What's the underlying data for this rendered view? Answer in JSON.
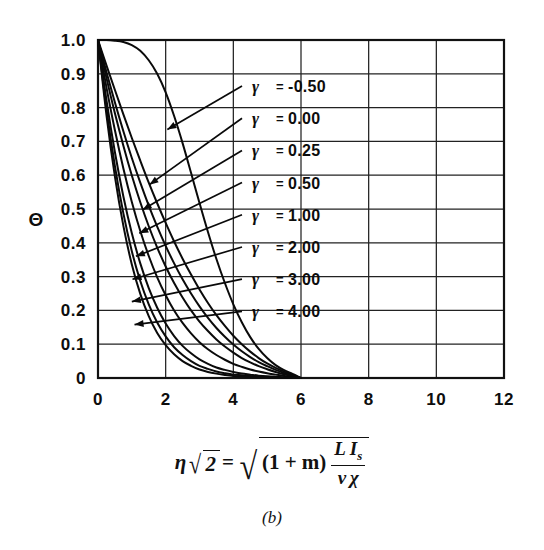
{
  "figure": {
    "panel_label": "(b)",
    "background_color": "#ffffff",
    "ink_color": "#0a0a0a"
  },
  "formula": {
    "lhs_var": "η",
    "lhs_radicand": "2",
    "equals": "=",
    "rhs_paren": "(1 + m)",
    "rhs_numerator_1": "L",
    "rhs_numerator_2": "I",
    "rhs_numerator_2_sub": "s",
    "rhs_denominator_1": "ν",
    "rhs_denominator_2": "χ",
    "plain_text": "η√2 = √( (1+m) L I_s / (ν χ) )"
  },
  "chart_data": {
    "type": "line",
    "title": "",
    "subtitle": "",
    "xlabel": "η√2 = √((1+m) L I_s / (ν χ))",
    "ylabel": "Θ",
    "xlim": [
      0,
      12
    ],
    "ylim": [
      0,
      1.0
    ],
    "xticks": [
      0,
      2,
      4,
      6,
      8,
      10,
      12
    ],
    "xticklabels": [
      "0",
      "2",
      "4",
      "6",
      "8",
      "10",
      "12"
    ],
    "yticks": [
      0,
      0.1,
      0.2,
      0.3,
      0.4,
      0.5,
      0.6,
      0.7,
      0.8,
      0.9,
      1.0
    ],
    "yticklabels": [
      "0",
      "0.1",
      "0.2",
      "0.3",
      "0.4",
      "0.5",
      "0.6",
      "0.7",
      "0.8",
      "0.9",
      "1.0"
    ],
    "grid": true,
    "grid_x_step": 2,
    "grid_y_step": 0.1,
    "legend_position": "inside-upper-right",
    "legend_symbol": "γ",
    "legend_equals": "=",
    "series": [
      {
        "name": "γ = -0.50",
        "gamma": -0.5,
        "label_value": "-0.50",
        "x": [
          0.0,
          0.25,
          0.5,
          0.75,
          1.0,
          1.25,
          1.5,
          1.75,
          2.0,
          2.25,
          2.5,
          2.75,
          3.0,
          3.25,
          3.5,
          3.75,
          4.0,
          4.25,
          4.5,
          4.75,
          5.0,
          5.25,
          5.5,
          5.75,
          6.0
        ],
        "y": [
          1.0,
          1.0,
          0.998,
          0.994,
          0.985,
          0.968,
          0.94,
          0.9,
          0.845,
          0.775,
          0.695,
          0.607,
          0.518,
          0.432,
          0.352,
          0.281,
          0.218,
          0.165,
          0.121,
          0.086,
          0.059,
          0.038,
          0.023,
          0.012,
          0.0
        ]
      },
      {
        "name": "γ = 0.00",
        "gamma": 0.0,
        "label_value": "0.00",
        "x": [
          0.0,
          0.25,
          0.5,
          0.75,
          1.0,
          1.25,
          1.5,
          1.75,
          2.0,
          2.25,
          2.5,
          2.75,
          3.0,
          3.25,
          3.5,
          3.75,
          4.0,
          4.25,
          4.5,
          4.75,
          5.0,
          5.25,
          5.5,
          5.75,
          6.0
        ],
        "y": [
          1.0,
          0.925,
          0.852,
          0.78,
          0.71,
          0.643,
          0.578,
          0.517,
          0.459,
          0.404,
          0.353,
          0.306,
          0.262,
          0.222,
          0.186,
          0.154,
          0.125,
          0.1,
          0.078,
          0.059,
          0.043,
          0.03,
          0.019,
          0.009,
          0.0
        ]
      },
      {
        "name": "γ = 0.25",
        "gamma": 0.25,
        "label_value": "0.25",
        "x": [
          0.0,
          0.25,
          0.5,
          0.75,
          1.0,
          1.25,
          1.5,
          1.75,
          2.0,
          2.25,
          2.5,
          2.75,
          3.0,
          3.25,
          3.5,
          3.75,
          4.0,
          4.25,
          4.5,
          4.75,
          5.0,
          5.25,
          5.5,
          5.75,
          6.0
        ],
        "y": [
          1.0,
          0.905,
          0.815,
          0.73,
          0.651,
          0.578,
          0.51,
          0.448,
          0.391,
          0.339,
          0.292,
          0.25,
          0.212,
          0.178,
          0.148,
          0.122,
          0.099,
          0.079,
          0.062,
          0.047,
          0.035,
          0.024,
          0.015,
          0.007,
          0.0
        ]
      },
      {
        "name": "γ = 0.50",
        "gamma": 0.5,
        "label_value": "0.50",
        "x": [
          0.0,
          0.25,
          0.5,
          0.75,
          1.0,
          1.25,
          1.5,
          1.75,
          2.0,
          2.25,
          2.5,
          2.75,
          3.0,
          3.25,
          3.5,
          3.75,
          4.0,
          4.25,
          4.5,
          4.75,
          5.0,
          5.25,
          5.5,
          5.75,
          6.0
        ],
        "y": [
          1.0,
          0.888,
          0.783,
          0.687,
          0.599,
          0.52,
          0.449,
          0.386,
          0.33,
          0.281,
          0.238,
          0.2,
          0.167,
          0.139,
          0.114,
          0.093,
          0.075,
          0.059,
          0.046,
          0.035,
          0.026,
          0.018,
          0.011,
          0.005,
          0.0
        ]
      },
      {
        "name": "γ = 1.00",
        "gamma": 1.0,
        "label_value": "1.00",
        "x": [
          0.0,
          0.25,
          0.5,
          0.75,
          1.0,
          1.25,
          1.5,
          1.75,
          2.0,
          2.25,
          2.5,
          2.75,
          3.0,
          3.25,
          3.5,
          3.75,
          4.0,
          4.25,
          4.5,
          4.75,
          5.0,
          5.25,
          5.5,
          5.75,
          6.0
        ],
        "y": [
          1.0,
          0.86,
          0.733,
          0.62,
          0.521,
          0.435,
          0.361,
          0.298,
          0.245,
          0.2,
          0.163,
          0.132,
          0.106,
          0.085,
          0.068,
          0.054,
          0.042,
          0.033,
          0.025,
          0.019,
          0.014,
          0.01,
          0.006,
          0.003,
          0.0
        ]
      },
      {
        "name": "γ = 2.00",
        "gamma": 2.0,
        "label_value": "2.00",
        "x": [
          0.0,
          0.25,
          0.5,
          0.75,
          1.0,
          1.25,
          1.5,
          1.75,
          2.0,
          2.25,
          2.5,
          2.75,
          3.0,
          3.25,
          3.5,
          3.75,
          4.0,
          4.25,
          4.5,
          4.75,
          5.0,
          5.25,
          5.5,
          5.75,
          6.0
        ],
        "y": [
          1.0,
          0.822,
          0.668,
          0.537,
          0.428,
          0.339,
          0.266,
          0.208,
          0.161,
          0.124,
          0.095,
          0.073,
          0.055,
          0.042,
          0.031,
          0.024,
          0.018,
          0.013,
          0.01,
          0.007,
          0.005,
          0.004,
          0.002,
          0.001,
          0.0
        ]
      },
      {
        "name": "γ = 3.00",
        "gamma": 3.0,
        "label_value": "3.00",
        "x": [
          0.0,
          0.25,
          0.5,
          0.75,
          1.0,
          1.25,
          1.5,
          1.75,
          2.0,
          2.25,
          2.5,
          2.75,
          3.0,
          3.25,
          3.5,
          3.75,
          4.0,
          4.25,
          4.5,
          4.75,
          5.0,
          5.25,
          5.5,
          5.75,
          6.0
        ],
        "y": [
          1.0,
          0.797,
          0.627,
          0.487,
          0.375,
          0.287,
          0.218,
          0.164,
          0.123,
          0.091,
          0.068,
          0.05,
          0.036,
          0.027,
          0.019,
          0.014,
          0.01,
          0.008,
          0.006,
          0.004,
          0.003,
          0.002,
          0.001,
          0.0005,
          0.0
        ]
      },
      {
        "name": "γ = 4.00",
        "gamma": 4.0,
        "label_value": "4.00",
        "x": [
          0.0,
          0.25,
          0.5,
          0.75,
          1.0,
          1.25,
          1.5,
          1.75,
          2.0,
          2.25,
          2.5,
          2.75,
          3.0,
          3.25,
          3.5,
          3.75,
          4.0,
          4.25,
          4.5,
          4.75,
          5.0,
          5.25,
          5.5,
          5.75,
          6.0
        ],
        "y": [
          1.0,
          0.778,
          0.596,
          0.45,
          0.336,
          0.249,
          0.183,
          0.133,
          0.097,
          0.07,
          0.05,
          0.036,
          0.025,
          0.018,
          0.013,
          0.009,
          0.006,
          0.005,
          0.003,
          0.002,
          0.002,
          0.001,
          0.001,
          0.0003,
          0.0
        ]
      }
    ],
    "annotations": [
      {
        "text": "γ = -0.50",
        "curve_index": 0,
        "anchor_x": 2.05,
        "anchor_y": 0.735
      },
      {
        "text": "γ = 0.00",
        "curve_index": 1,
        "anchor_x": 1.52,
        "anchor_y": 0.572
      },
      {
        "text": "γ = 0.25",
        "curve_index": 2,
        "anchor_x": 1.32,
        "anchor_y": 0.498
      },
      {
        "text": "γ = 0.50",
        "curve_index": 3,
        "anchor_x": 1.22,
        "anchor_y": 0.428
      },
      {
        "text": "γ = 1.00",
        "curve_index": 4,
        "anchor_x": 1.12,
        "anchor_y": 0.36
      },
      {
        "text": "γ = 2.00",
        "curve_index": 5,
        "anchor_x": 1.02,
        "anchor_y": 0.292
      },
      {
        "text": "γ = 3.00",
        "curve_index": 6,
        "anchor_x": 1.0,
        "anchor_y": 0.226
      },
      {
        "text": "γ = 4.00",
        "curve_index": 7,
        "anchor_x": 1.08,
        "anchor_y": 0.158
      }
    ]
  }
}
